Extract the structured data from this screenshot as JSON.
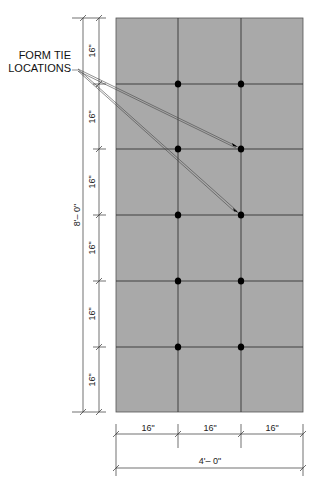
{
  "diagram": {
    "callout": {
      "line1": "FORM TIE",
      "line2": "LOCATIONS"
    },
    "panel": {
      "color": "#a9a9a9",
      "columns": 3,
      "rows": 6
    },
    "dimensions": {
      "vertical_segments": [
        "16\"",
        "16\"",
        "16\"",
        "16\"",
        "16\"",
        "16\""
      ],
      "vertical_total": "8'– 0\"",
      "horizontal_segments": [
        "16\"",
        "16\"",
        "16\""
      ],
      "horizontal_total": "4'– 0\""
    },
    "form_ties": {
      "count": 10,
      "color": "#000000"
    }
  }
}
